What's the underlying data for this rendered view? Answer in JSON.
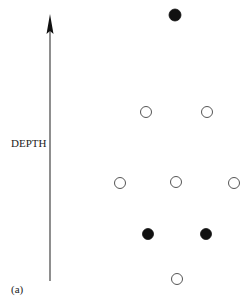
{
  "figure": {
    "axis_label": "DEPTH",
    "panel_label": "(a)",
    "axis": {
      "x": 50,
      "y_top": 14,
      "y_bottom": 281,
      "direction": "up"
    },
    "colors": {
      "ink": "#222222",
      "background": "#ffffff"
    },
    "nodes": [
      {
        "x": 175,
        "y": 15,
        "r": 6,
        "filled": true
      },
      {
        "x": 146,
        "y": 112,
        "r": 5.5,
        "filled": false
      },
      {
        "x": 207,
        "y": 112,
        "r": 5.5,
        "filled": false
      },
      {
        "x": 120,
        "y": 183,
        "r": 5.5,
        "filled": false
      },
      {
        "x": 176,
        "y": 182,
        "r": 5.5,
        "filled": false
      },
      {
        "x": 234,
        "y": 183,
        "r": 5.5,
        "filled": false
      },
      {
        "x": 148,
        "y": 234,
        "r": 5.5,
        "filled": true
      },
      {
        "x": 206,
        "y": 234,
        "r": 5.5,
        "filled": true
      },
      {
        "x": 177,
        "y": 279,
        "r": 5.5,
        "filled": false
      }
    ]
  }
}
